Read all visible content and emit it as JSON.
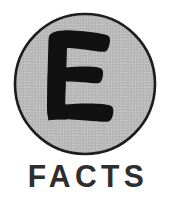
{
  "logo": {
    "name": "E FACTS logo",
    "background_color": "#ffffff",
    "badge": {
      "shape": "circle",
      "fill_color": "#b9b9b9",
      "outline_color": "#1a1a1a",
      "outline_width_px": 2,
      "diameter_px": 142,
      "center_x_px": 84,
      "center_y_px": 84
    },
    "monogram": {
      "letter": "E",
      "style": "hand-drawn brush uppercase",
      "color": "#111111"
    },
    "wordmark": {
      "text": "FACTS",
      "color": "#2e2e2e",
      "weight": "bold",
      "letter_spacing_px": 4.5
    }
  }
}
